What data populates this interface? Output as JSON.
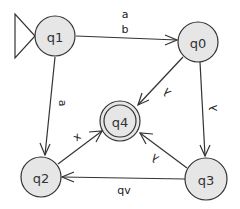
{
  "diagram": {
    "type": "finite-automaton",
    "colors": {
      "state_fill": "#e6e6e6",
      "stroke": "#333333",
      "background": "#ffffff"
    },
    "states": [
      {
        "id": "q1",
        "label": "q1",
        "initial": true,
        "final": false
      },
      {
        "id": "q0",
        "label": "q0",
        "initial": false,
        "final": false
      },
      {
        "id": "q4",
        "label": "q4",
        "initial": false,
        "final": true
      },
      {
        "id": "q2",
        "label": "q2",
        "initial": false,
        "final": false
      },
      {
        "id": "q3",
        "label": "q3",
        "initial": false,
        "final": false
      }
    ],
    "transitions": [
      {
        "from": "q1",
        "to": "q0",
        "labels": [
          "a",
          "b"
        ]
      },
      {
        "from": "q1",
        "to": "q2",
        "labels": [
          "a"
        ]
      },
      {
        "from": "q0",
        "to": "q4",
        "labels": [
          "λ"
        ]
      },
      {
        "from": "q0",
        "to": "q3",
        "labels": [
          "λ"
        ]
      },
      {
        "from": "q3",
        "to": "q4",
        "labels": [
          "λ"
        ]
      },
      {
        "from": "q2",
        "to": "q4",
        "labels": [
          "x"
        ]
      },
      {
        "from": "q3",
        "to": "q2",
        "labels": [
          "qv"
        ]
      }
    ]
  }
}
